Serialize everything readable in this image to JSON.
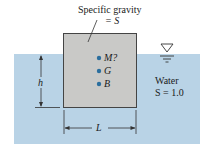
{
  "figure": {
    "colors": {
      "water": "#b9d3e6",
      "block": "#c9c9c7",
      "block_border": "#444444",
      "point": "#2a6e9e",
      "line": "#222222"
    },
    "block_label": {
      "line1": "Specific gravity",
      "line2": "= S"
    },
    "points": [
      {
        "symbol": "M?",
        "name": "metacenter"
      },
      {
        "symbol": "G",
        "name": "center-of-gravity"
      },
      {
        "symbol": "B",
        "name": "center-of-buoyancy"
      }
    ],
    "water_label": {
      "line1": "Water",
      "line2": "S = 1.0"
    },
    "dimensions": {
      "depth": "h",
      "width": "L"
    },
    "free_surface_symbol": "inverted-triangle"
  }
}
